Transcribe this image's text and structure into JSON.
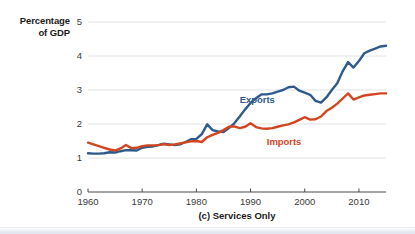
{
  "chart_data": {
    "type": "line",
    "title": "",
    "caption": "(c) Services Only",
    "ylabel_lines": [
      "Percentage",
      "of GDP"
    ],
    "ylabel": "Percentage of GDP",
    "xlabel": "",
    "xlim": [
      1960,
      2015
    ],
    "ylim": [
      0,
      5
    ],
    "yticks": [
      "0",
      "1",
      "2",
      "3",
      "4",
      "5"
    ],
    "ytick_values": [
      0,
      1,
      2,
      3,
      4,
      5
    ],
    "xticks": [
      "1960",
      "1970",
      "1980",
      "1990",
      "2000",
      "2010"
    ],
    "xtick_values": [
      1960,
      1970,
      1980,
      1990,
      2000,
      2010
    ],
    "grid": "horizontal",
    "legend_position": "inline-annotation",
    "colors": {
      "exports": "#2E5A8C",
      "imports": "#D2451E",
      "gridline": "#E2E2E2",
      "axis": "#4A4A4A",
      "text": "#1A1A1A",
      "tick_text": "#3A3A3A"
    },
    "series": [
      {
        "name": "Exports",
        "color": "#2E5A8C",
        "label_x": 1988,
        "label_y": 2.72,
        "x": [
          1960,
          1961,
          1962,
          1963,
          1964,
          1965,
          1966,
          1967,
          1968,
          1969,
          1970,
          1971,
          1972,
          1973,
          1974,
          1975,
          1976,
          1977,
          1978,
          1979,
          1980,
          1981,
          1982,
          1983,
          1984,
          1985,
          1986,
          1987,
          1988,
          1989,
          1990,
          1991,
          1992,
          1993,
          1994,
          1995,
          1996,
          1997,
          1998,
          1999,
          2000,
          2001,
          2002,
          2003,
          2004,
          2005,
          2006,
          2007,
          2008,
          2009,
          2010,
          2011,
          2012,
          2013,
          2014,
          2015
        ],
        "values": [
          1.14,
          1.13,
          1.13,
          1.14,
          1.17,
          1.16,
          1.2,
          1.23,
          1.23,
          1.22,
          1.3,
          1.33,
          1.34,
          1.38,
          1.42,
          1.4,
          1.38,
          1.4,
          1.47,
          1.55,
          1.56,
          1.7,
          1.99,
          1.82,
          1.78,
          1.76,
          1.88,
          2.02,
          2.22,
          2.43,
          2.62,
          2.76,
          2.87,
          2.87,
          2.9,
          2.95,
          3.0,
          3.08,
          3.1,
          2.98,
          2.92,
          2.86,
          2.68,
          2.63,
          2.78,
          3.0,
          3.2,
          3.55,
          3.82,
          3.66,
          3.85,
          4.08,
          4.16,
          4.22,
          4.28,
          4.3
        ]
      },
      {
        "name": "Imports",
        "color": "#D2451E",
        "label_x": 1993,
        "label_y": 1.46,
        "x": [
          1960,
          1961,
          1962,
          1963,
          1964,
          1965,
          1966,
          1967,
          1968,
          1969,
          1970,
          1971,
          1972,
          1973,
          1974,
          1975,
          1976,
          1977,
          1978,
          1979,
          1980,
          1981,
          1982,
          1983,
          1984,
          1985,
          1986,
          1987,
          1988,
          1989,
          1990,
          1991,
          1992,
          1993,
          1994,
          1995,
          1996,
          1997,
          1998,
          1999,
          2000,
          2001,
          2002,
          2003,
          2004,
          2005,
          2006,
          2007,
          2008,
          2009,
          2010,
          2011,
          2012,
          2013,
          2014,
          2015
        ],
        "values": [
          1.45,
          1.4,
          1.35,
          1.3,
          1.25,
          1.22,
          1.28,
          1.38,
          1.29,
          1.3,
          1.35,
          1.37,
          1.37,
          1.38,
          1.41,
          1.38,
          1.4,
          1.43,
          1.46,
          1.49,
          1.5,
          1.47,
          1.61,
          1.68,
          1.74,
          1.82,
          1.92,
          1.93,
          1.88,
          1.92,
          2.02,
          1.91,
          1.87,
          1.86,
          1.88,
          1.92,
          1.96,
          1.99,
          2.05,
          2.12,
          2.2,
          2.13,
          2.14,
          2.22,
          2.38,
          2.48,
          2.6,
          2.75,
          2.9,
          2.72,
          2.78,
          2.84,
          2.86,
          2.88,
          2.9,
          2.9
        ]
      }
    ]
  }
}
